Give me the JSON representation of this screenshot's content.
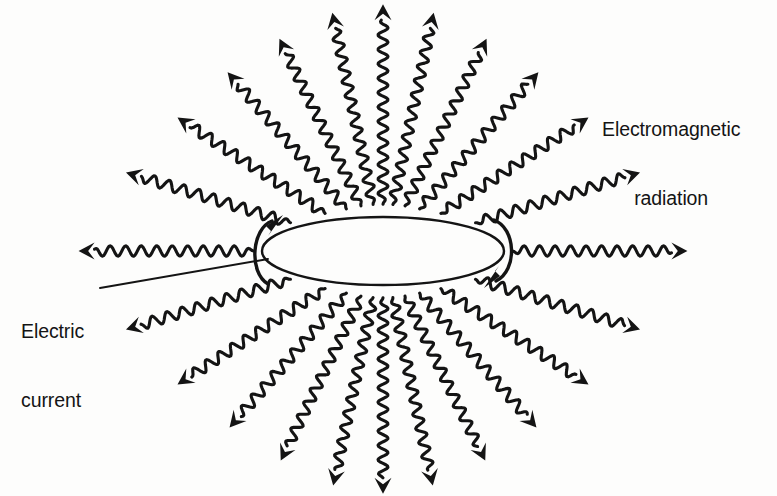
{
  "figure": {
    "background_color": "#fdfdfc",
    "ink_color": "#141414"
  },
  "labels": {
    "em_radiation": {
      "line1": "Electromagnetic",
      "line2": "radiation"
    },
    "electric_current": {
      "line1": "Electric",
      "line2": "current"
    }
  },
  "loop": {
    "name": "current-loop-ellipse",
    "center_x": 383,
    "center_y": 251,
    "radius_x": 121,
    "radius_y": 34,
    "stroke_width": 2.4
  },
  "current_arrows": [
    {
      "name": "current-arrow-left",
      "side": "left",
      "direction": "up-right",
      "description": "C-shaped arc at left end of loop with arrowhead pointing up and to the right"
    },
    {
      "name": "current-arrow-right",
      "side": "right",
      "direction": "down-left",
      "description": "reversed C-shaped arc at right end of loop with arrowhead pointing down and to the left"
    }
  ],
  "leader_line": {
    "name": "electric-current-leader",
    "from_x": 100,
    "from_y": 288,
    "to_x": 268,
    "to_y": 259
  },
  "chart_data": {
    "type": "diagram",
    "title": "Electromagnetic radiation",
    "ray_count": 26,
    "rays": [
      {
        "angle_deg": 180,
        "start_r": 1.02,
        "length": 175,
        "wavelength": 15.5,
        "amplitude": 5.2
      },
      {
        "angle_deg": 163,
        "start_r": 1.06,
        "length": 172,
        "wavelength": 15.5,
        "amplitude": 5.2
      },
      {
        "angle_deg": 147,
        "start_r": 1.1,
        "length": 176,
        "wavelength": 15.0,
        "amplitude": 5.2
      },
      {
        "angle_deg": 131,
        "start_r": 1.14,
        "length": 181,
        "wavelength": 15.0,
        "amplitude": 5.2
      },
      {
        "angle_deg": 116,
        "start_r": 1.18,
        "length": 186,
        "wavelength": 14.6,
        "amplitude": 5.0
      },
      {
        "angle_deg": 102,
        "start_r": 1.2,
        "length": 196,
        "wavelength": 14.4,
        "amplitude": 5.0
      },
      {
        "angle_deg": 90,
        "start_r": 1.2,
        "length": 200,
        "wavelength": 14.4,
        "amplitude": 5.0
      },
      {
        "angle_deg": 78,
        "start_r": 1.2,
        "length": 196,
        "wavelength": 14.4,
        "amplitude": 5.0
      },
      {
        "angle_deg": 64,
        "start_r": 1.18,
        "length": 186,
        "wavelength": 14.6,
        "amplitude": 5.0
      },
      {
        "angle_deg": 49,
        "start_r": 1.14,
        "length": 181,
        "wavelength": 15.0,
        "amplitude": 5.2
      },
      {
        "angle_deg": 33,
        "start_r": 1.1,
        "length": 176,
        "wavelength": 15.0,
        "amplitude": 5.2
      },
      {
        "angle_deg": 17,
        "start_r": 1.06,
        "length": 172,
        "wavelength": 15.5,
        "amplitude": 5.2
      },
      {
        "angle_deg": 0,
        "start_r": 1.02,
        "length": 175,
        "wavelength": 15.5,
        "amplitude": 5.2
      },
      {
        "angle_deg": -17,
        "start_r": 1.06,
        "length": 172,
        "wavelength": 15.5,
        "amplitude": 5.2
      },
      {
        "angle_deg": -33,
        "start_r": 1.1,
        "length": 176,
        "wavelength": 15.0,
        "amplitude": 5.2
      },
      {
        "angle_deg": -49,
        "start_r": 1.14,
        "length": 178,
        "wavelength": 15.0,
        "amplitude": 5.2
      },
      {
        "angle_deg": -64,
        "start_r": 1.18,
        "length": 183,
        "wavelength": 14.6,
        "amplitude": 5.0
      },
      {
        "angle_deg": -78,
        "start_r": 1.2,
        "length": 192,
        "wavelength": 14.4,
        "amplitude": 5.0
      },
      {
        "angle_deg": -90,
        "start_r": 1.2,
        "length": 196,
        "wavelength": 14.4,
        "amplitude": 5.0
      },
      {
        "angle_deg": -102,
        "start_r": 1.2,
        "length": 192,
        "wavelength": 14.4,
        "amplitude": 5.0
      },
      {
        "angle_deg": -116,
        "start_r": 1.18,
        "length": 183,
        "wavelength": 14.6,
        "amplitude": 5.0
      },
      {
        "angle_deg": -131,
        "start_r": 1.14,
        "length": 178,
        "wavelength": 15.0,
        "amplitude": 5.2
      },
      {
        "angle_deg": -147,
        "start_r": 1.1,
        "length": 176,
        "wavelength": 15.0,
        "amplitude": 5.2
      },
      {
        "angle_deg": -163,
        "start_r": 1.06,
        "length": 172,
        "wavelength": 15.5,
        "amplitude": 5.2
      }
    ]
  }
}
